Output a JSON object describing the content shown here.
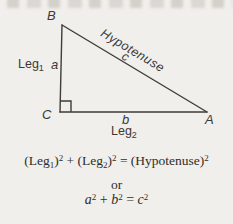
{
  "figure": {
    "vertices": {
      "top": "B",
      "bottom_left": "C",
      "bottom_right": "A"
    },
    "leg1": {
      "word": "Leg",
      "sub": "1",
      "variable": "a"
    },
    "leg2": {
      "word": "Leg",
      "sub": "2",
      "variable": "b"
    },
    "hypotenuse": {
      "word": "Hypotenuse",
      "variable": "c"
    }
  },
  "equations": {
    "verbal": {
      "p1": "(Leg",
      "sub1": "1",
      "p2": ")",
      "sup1": "2",
      "p3": " + (Leg",
      "sub2": "2",
      "p4": ")",
      "sup2": "2",
      "p5": " = (Hypotenuse)",
      "sup3": "2"
    },
    "connector": "or",
    "symbolic": {
      "a": "a",
      "sup_a": "2",
      "plus": " + ",
      "b": "b",
      "sup_b": "2",
      "eq": " = ",
      "c": "c",
      "sup_c": "2"
    }
  },
  "colors": {
    "background": "#f1efeb",
    "line": "#3e3d3a",
    "text": "#2e2d2a"
  }
}
